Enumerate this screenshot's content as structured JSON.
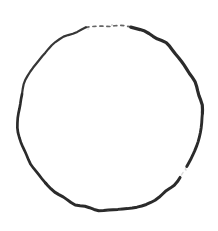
{
  "document": {
    "title": "Hand-drawn circle",
    "kind": "freehand-sketch",
    "media": "ink-on-paper",
    "canvas": {
      "width": 218,
      "height": 231,
      "background_color": "#ffffff"
    }
  },
  "artwork": {
    "name": "circle-sketch",
    "description": "A single freehand closed circle drawn in dark ink, slightly irregular, with a broken dashed segment at the top and a small break on the lower-right arc.",
    "stroke_color": "#2b2b2b",
    "stroke_color_light": "#4a4a4a",
    "stroke_width_min": 1.6,
    "stroke_width_max": 3.4,
    "geometry": {
      "center_x": 110,
      "center_y": 118,
      "radius_x": 92,
      "radius_y": 93,
      "bounds": {
        "left": 18,
        "top": 25,
        "right": 202,
        "bottom": 212
      }
    },
    "segments": [
      {
        "name": "top-dashed-gap",
        "label": "Top dashed gap",
        "start_angle_deg": 255,
        "end_angle_deg": 283,
        "stroke_width": 1.7,
        "opacity": 0.85,
        "dashed": true
      },
      {
        "name": "upper-right-arc",
        "label": "Upper right arc",
        "start_angle_deg": 283,
        "end_angle_deg": 357,
        "stroke_width": 3.2,
        "opacity": 1,
        "dashed": false
      },
      {
        "name": "right-arc",
        "label": "Right arc",
        "start_angle_deg": 357,
        "end_angle_deg": 32,
        "stroke_width": 2.9,
        "opacity": 1,
        "dashed": false
      },
      {
        "name": "lower-right-break",
        "label": "Lower right break",
        "start_angle_deg": 32,
        "end_angle_deg": 40,
        "stroke_width": 1.4,
        "opacity": 0.2,
        "dashed": true
      },
      {
        "name": "bottom-arc",
        "label": "Bottom arc",
        "start_angle_deg": 40,
        "end_angle_deg": 135,
        "stroke_width": 3.0,
        "opacity": 1,
        "dashed": false
      },
      {
        "name": "lower-left-arc",
        "label": "Lower left arc",
        "start_angle_deg": 135,
        "end_angle_deg": 195,
        "stroke_width": 2.7,
        "opacity": 1,
        "dashed": false
      },
      {
        "name": "upper-left-arc",
        "label": "Upper left arc",
        "start_angle_deg": 195,
        "end_angle_deg": 255,
        "stroke_width": 2.2,
        "opacity": 0.95,
        "dashed": false
      }
    ],
    "speckles": [
      {
        "cx": 101,
        "cy": 26,
        "r": 0.8
      },
      {
        "cx": 95,
        "cy": 27,
        "r": 0.7
      },
      {
        "cx": 88,
        "cy": 29,
        "r": 0.7
      },
      {
        "cx": 112,
        "cy": 25,
        "r": 0.9
      },
      {
        "cx": 120,
        "cy": 209,
        "r": 0.8
      },
      {
        "cx": 108,
        "cy": 211,
        "r": 0.9
      },
      {
        "cx": 186,
        "cy": 170,
        "r": 0.7
      }
    ]
  }
}
